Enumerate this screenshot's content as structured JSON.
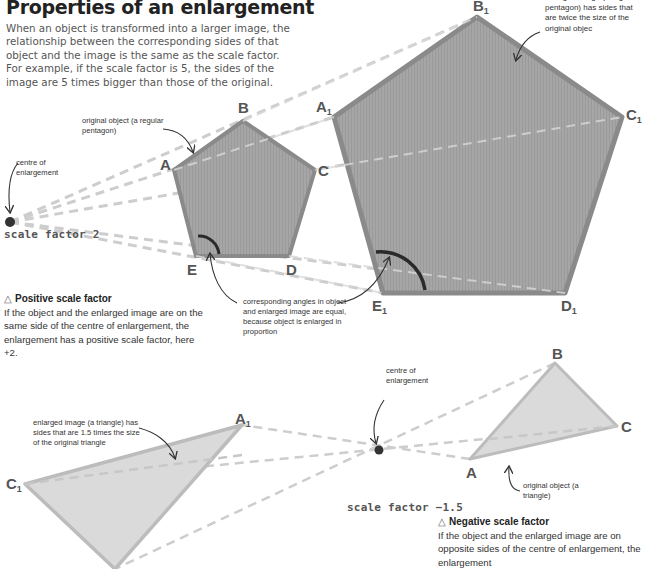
{
  "header": {
    "title": "Properties of an enlargement",
    "intro": "When an object is transformed into a larger image, the relationship between the corresponding sides of that object and the image is the same as the scale factor. For example, if the scale factor is 5, the sides of the image are 5 times bigger than those of the original."
  },
  "positive": {
    "scale_label": "scale factor 2",
    "centre_label": "centre of enlargement",
    "original_label": "original object (a regular pentagon)",
    "enlarged_label": "enlarged image (a regular pentagon) has sides that are twice the size of the original objec",
    "angle_label": "corresponding angles in object and enlarged image are equal, because object is enlarged in proportion",
    "vertices": {
      "A": "A",
      "B": "B",
      "C": "C",
      "D": "D",
      "E": "E",
      "A1": "A",
      "B1": "B",
      "C1": "C",
      "D1": "D",
      "E1": "E",
      "sub": "1"
    },
    "box_icon": "△",
    "box_title": "Positive scale factor",
    "box_text": "If the object and the enlarged image are on the same side of the centre of enlargement, the enlargement has a positive scale factor, here +2."
  },
  "negative": {
    "scale_label": "scale factor −1.5",
    "centre_label": "centre of enlargement",
    "original_label": "original object (a triangle)",
    "enlarged_label": "enlarged image (a triangle) has sides that are 1.5 times the size of the original triangle",
    "vertices": {
      "A": "A",
      "B": "B",
      "C": "C",
      "A1": "A",
      "C1": "C",
      "sub": "1"
    },
    "box_icon": "△",
    "box_title": "Negative scale factor",
    "box_text": "If the object and the enlarged image are on opposite sides of the centre of enlargement, the enlargement"
  },
  "colors": {
    "pentagon_fill": "#a3a3a3",
    "pentagon_stroke": "#8c8c8c",
    "triangle_fill": "#dcdcdc",
    "triangle_stroke": "#bdbdbd",
    "dash": "#cfcfcf",
    "centre_dot": "#333333",
    "angle_arc": "#2a2a2a"
  }
}
